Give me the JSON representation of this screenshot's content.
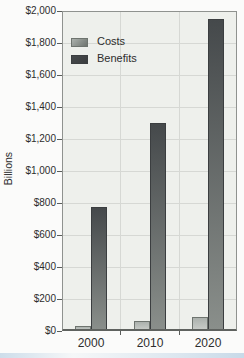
{
  "figure": {
    "y_axis_label": "Billions",
    "y_tick_labels": [
      "$0",
      "$200",
      "$400",
      "$600",
      "$800",
      "$1,000",
      "$1,200",
      "$1,400",
      "$1,600",
      "$1,800",
      "$2,000"
    ],
    "x_tick_labels": [
      "2000",
      "2010",
      "2020"
    ],
    "legend": {
      "costs_label": "Costs",
      "benefits_label": "Benefits"
    }
  },
  "chart_data": {
    "type": "bar",
    "title": "",
    "subtitle": "",
    "categories": [
      "2000",
      "2010",
      "2020"
    ],
    "series": [
      {
        "name": "Costs",
        "values": [
          30,
          65,
          90
        ],
        "fill_top": "#abb1ad",
        "fill_bottom": "#c9cdc9",
        "border": "#6e746f",
        "legend_color": "#9aa09c"
      },
      {
        "name": "Benefits",
        "values": [
          775,
          1300,
          1950
        ],
        "fill_top": "#45494b",
        "fill_bottom": "#8a8f8b",
        "border": "#3b3e40",
        "legend_color": "#4d5254"
      }
    ],
    "xlabel": "",
    "ylabel": "Billions",
    "ylim": [
      0,
      2000
    ],
    "ytick_interval": 200,
    "ytick_format": "$#,##0 billions",
    "grid": true,
    "grid_color": "#d6d8d4",
    "plot_background": "#eef0ec",
    "legend_position": "top-left-inside",
    "legend_entries": [
      "Costs",
      "Benefits"
    ]
  }
}
